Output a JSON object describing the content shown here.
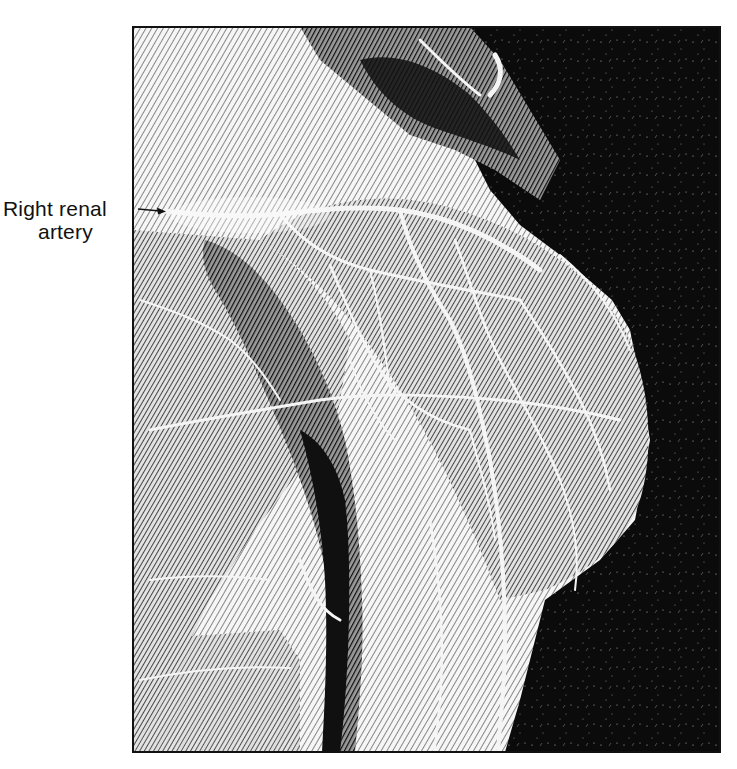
{
  "figure": {
    "frame": {
      "x": 133,
      "y": 27,
      "width": 587,
      "height": 725,
      "border_color": "#111111"
    },
    "colors": {
      "background": "#ffffff",
      "ink": "#111111",
      "highlight": "#f4f4f4",
      "dark_field": "#0c0c0c"
    }
  },
  "annotations": [
    {
      "id": "right-renal-artery",
      "text_line1": "Right renal",
      "text_line2": "artery",
      "arrow": {
        "from": [
          138,
          209
        ],
        "to": [
          166,
          211
        ]
      }
    }
  ]
}
